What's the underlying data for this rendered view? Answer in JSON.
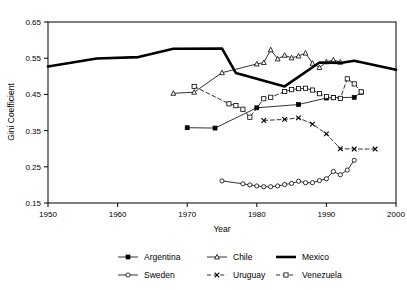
{
  "chart_data": {
    "type": "line",
    "title": "",
    "xlabel": "Year",
    "ylabel": "Gini Coefficient",
    "xlim": [
      1950,
      2000
    ],
    "ylim": [
      0.15,
      0.65
    ],
    "xticks": [
      1950,
      1960,
      1970,
      1980,
      1990,
      2000
    ],
    "xtick_labels": [
      "1950",
      "1960",
      "1970",
      "1980",
      "1990",
      "2000"
    ],
    "yticks": [
      0.15,
      0.25,
      0.35,
      0.45,
      0.55,
      0.65
    ],
    "ytick_labels": [
      "0.15",
      "0.25",
      "0.35",
      "0.45",
      "0.55",
      "0.65"
    ],
    "grid": false,
    "legend_position": "bottom",
    "series": [
      {
        "name": "Argentina",
        "color": "#000000",
        "marker": "square-filled",
        "dash": "none",
        "width": 0.8,
        "x": [
          1970,
          1974,
          1980,
          1986,
          1990,
          1991,
          1994,
          1995
        ],
        "y": [
          0.358,
          0.357,
          0.413,
          0.422,
          0.44,
          0.441,
          0.442,
          0.456
        ]
      },
      {
        "name": "Chile",
        "color": "#000000",
        "marker": "triangle-open",
        "dash": "none",
        "width": 0.8,
        "x": [
          1968,
          1971,
          1975,
          1980,
          1981,
          1982,
          1983,
          1984,
          1985,
          1986,
          1987,
          1988,
          1989,
          1990,
          1991,
          1992
        ],
        "y": [
          0.453,
          0.456,
          0.51,
          0.534,
          0.538,
          0.573,
          0.548,
          0.558,
          0.551,
          0.556,
          0.564,
          0.536,
          0.524,
          0.54,
          0.545,
          0.539
        ]
      },
      {
        "name": "Mexico",
        "color": "#000000",
        "marker": "none",
        "dash": "none",
        "width": 2.6,
        "x": [
          1950,
          1957,
          1963,
          1968,
          1975,
          1977,
          1984,
          1989,
          1992,
          1994,
          2000
        ],
        "y": [
          0.527,
          0.549,
          0.553,
          0.576,
          0.577,
          0.509,
          0.472,
          0.538,
          0.537,
          0.543,
          0.518
        ]
      },
      {
        "name": "Sweden",
        "color": "#000000",
        "marker": "circle-open",
        "dash": "none",
        "width": 0.8,
        "x": [
          1975,
          1978,
          1979,
          1980,
          1981,
          1982,
          1983,
          1984,
          1985,
          1986,
          1987,
          1988,
          1989,
          1990,
          1991,
          1992,
          1993,
          1994
        ],
        "y": [
          0.211,
          0.203,
          0.2,
          0.197,
          0.195,
          0.195,
          0.197,
          0.201,
          0.204,
          0.21,
          0.206,
          0.206,
          0.212,
          0.217,
          0.237,
          0.228,
          0.241,
          0.268
        ]
      },
      {
        "name": "Uruguay",
        "color": "#000000",
        "marker": "x-mark",
        "dash": "dashed",
        "width": 0.8,
        "x": [
          1981,
          1984,
          1986,
          1988,
          1990,
          1992,
          1994,
          1997
        ],
        "y": [
          0.378,
          0.381,
          0.385,
          0.368,
          0.341,
          0.3,
          0.299,
          0.299
        ]
      },
      {
        "name": "Venezuela",
        "color": "#000000",
        "marker": "square-open",
        "dash": "dashed",
        "width": 0.8,
        "x": [
          1971,
          1976,
          1977,
          1978,
          1979,
          1981,
          1982,
          1984,
          1985,
          1986,
          1987,
          1988,
          1989,
          1990,
          1991,
          1992,
          1993,
          1994,
          1995
        ],
        "y": [
          0.472,
          0.424,
          0.419,
          0.409,
          0.387,
          0.438,
          0.442,
          0.458,
          0.463,
          0.466,
          0.467,
          0.462,
          0.452,
          0.444,
          0.441,
          0.439,
          0.493,
          0.479,
          0.457
        ]
      }
    ]
  },
  "legend": {
    "items": [
      {
        "label": "Argentina"
      },
      {
        "label": "Chile"
      },
      {
        "label": "Mexico"
      },
      {
        "label": "Sweden"
      },
      {
        "label": "Uruguay"
      },
      {
        "label": "Venezuela"
      }
    ]
  }
}
